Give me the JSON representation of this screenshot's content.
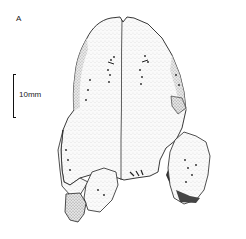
{
  "figure": {
    "panel_label": "A",
    "scale_bar": {
      "label": "10mm"
    }
  }
}
